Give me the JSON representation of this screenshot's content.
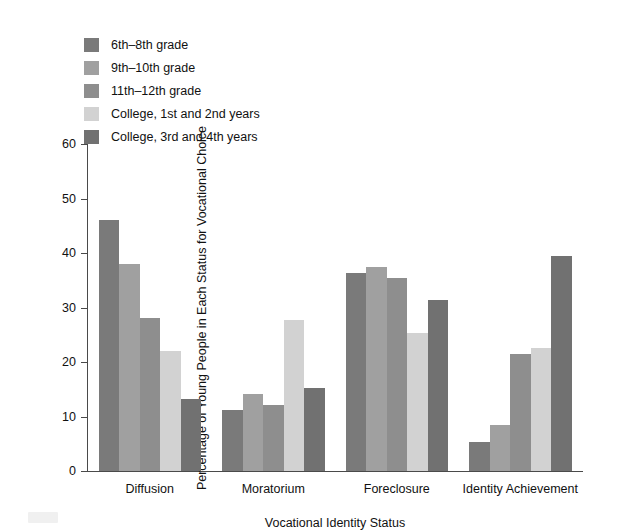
{
  "chart_data": {
    "type": "bar",
    "title": "",
    "xlabel": "Vocational Identity Status",
    "ylabel": "Percentage of Young People in Each Status for Vocational Choice",
    "categories": [
      "Diffusion",
      "Moratorium",
      "Foreclosure",
      "Identity Achievement"
    ],
    "ylim": [
      0,
      60
    ],
    "yticks": [
      0,
      10,
      20,
      30,
      40,
      50,
      60
    ],
    "ytick_labels": [
      "0",
      "10",
      "20",
      "30",
      "40",
      "50",
      "60"
    ],
    "grid": false,
    "legend_position": "top-left",
    "series": [
      {
        "name": "6th–8th grade",
        "color": "#7a7a7a",
        "values": [
          46.0,
          11.2,
          36.3,
          5.3
        ]
      },
      {
        "name": "9th–10th grade",
        "color": "#a0a0a0",
        "values": [
          38.0,
          14.2,
          37.4,
          8.5
        ]
      },
      {
        "name": "11th–12th grade",
        "color": "#8e8e8e",
        "values": [
          28.0,
          12.2,
          35.4,
          21.5
        ]
      },
      {
        "name": "College, 1st and 2nd years",
        "color": "#d2d2d2",
        "values": [
          22.1,
          27.8,
          25.3,
          22.5
        ]
      },
      {
        "name": "College, 3rd and 4th years",
        "color": "#717171",
        "values": [
          13.2,
          15.2,
          31.3,
          39.5
        ]
      }
    ]
  },
  "legend": {
    "items": [
      {
        "label": "6th–8th grade",
        "color": "#7a7a7a"
      },
      {
        "label": "9th–10th grade",
        "color": "#a0a0a0"
      },
      {
        "label": "11th–12th grade",
        "color": "#8e8e8e"
      },
      {
        "label": "College, 1st and 2nd years",
        "color": "#d2d2d2"
      },
      {
        "label": "College, 3rd and 4th years",
        "color": "#717171"
      }
    ]
  },
  "axes": {
    "y_title": "Percentage of Young People in Each Status for Vocational Choice",
    "x_title": "Vocational Identity Status"
  }
}
